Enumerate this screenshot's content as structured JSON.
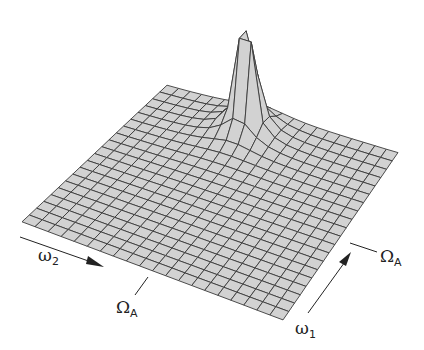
{
  "figure": {
    "type": "3d-surface-mesh",
    "grid_size": 20,
    "peak_position": {
      "u": 0.42,
      "v": 0.13
    },
    "surface_color": "#d2d2d2",
    "side_color": "#c4c4c4",
    "line_color": "#3a3a3a"
  },
  "labels": {
    "omega2": {
      "symbol": "ω",
      "subscript": "2"
    },
    "omega1": {
      "symbol": "ω",
      "subscript": "1"
    },
    "omegaA_left": {
      "symbol": "Ω",
      "subscript": "A"
    },
    "omegaA_right": {
      "symbol": "Ω",
      "subscript": "A"
    }
  },
  "projection": {
    "corner_back": [
      167,
      86
    ],
    "corner_right": [
      398,
      153
    ],
    "corner_front": [
      283,
      320
    ],
    "corner_left": [
      22,
      222
    ],
    "height_scale": 215
  }
}
